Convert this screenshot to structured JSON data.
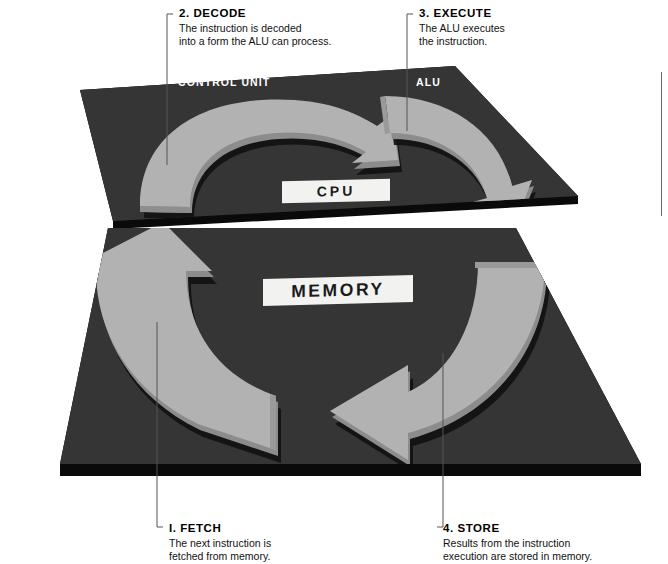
{
  "diagram": {
    "platforms": [
      {
        "id": "cpu",
        "plate_label": "CPU",
        "component_labels": [
          "CONTROL UNIT",
          "ALU"
        ]
      },
      {
        "id": "memory",
        "plate_label": "MEMORY",
        "component_labels": []
      }
    ],
    "slab_labels": {
      "control_unit": "CONTROL UNIT",
      "alu": "ALU"
    },
    "plates": {
      "cpu": "CPU",
      "memory": "MEMORY"
    },
    "steps": [
      {
        "number": "I.",
        "title": "FETCH",
        "body": "The next instruction is fetched from memory.",
        "body_line1": "The next instruction is",
        "body_line2": "fetched from memory."
      },
      {
        "number": "2.",
        "title": "DECODE",
        "body": "The instruction is decoded into a form the ALU can process.",
        "body_line1": "The instruction is decoded",
        "body_line2": "into a form the ALU can process."
      },
      {
        "number": "3.",
        "title": "EXECUTE",
        "body": "The ALU executes the instruction.",
        "body_line1": "The ALU executes",
        "body_line2": "the instruction."
      },
      {
        "number": "4.",
        "title": "STORE",
        "body": "Results from the instruction execution are stored in memory.",
        "body_line1": "Results from the instruction",
        "body_line2": "execution are stored in memory."
      }
    ],
    "colors": {
      "background": "#ffffff",
      "slab_top": "#333333",
      "slab_edge": "#0a0a0a",
      "arrow_face": "#b2b2b2",
      "arrow_side": "#8c8c8c",
      "arrow_shadow": "#111111",
      "plate_bg": "#f2f2f0",
      "plate_text": "#1a1a1a",
      "label_text": "#ffffff",
      "callout_text": "#000000",
      "leader_line": "#555555"
    }
  }
}
